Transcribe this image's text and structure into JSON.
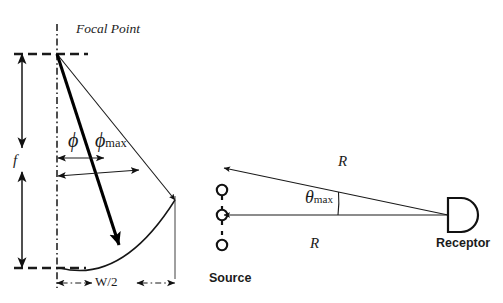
{
  "figure": {
    "width": 503,
    "height": 303,
    "background": "#ffffff",
    "ink_color": "#111111",
    "title": ""
  },
  "labels": {
    "focal_point": "Focal Point",
    "focal_length": "f",
    "phi": "ϕ",
    "phi_max_symbol": "ϕ",
    "phi_max_subscript": "max",
    "half_width": "W/2",
    "range_upper": "R",
    "range_lower": "R",
    "theta_max_symbol": "θ",
    "theta_max_subscript": "max",
    "source": "Source",
    "receptor": "Receptor"
  },
  "left_panel": {
    "name": "parabolic-reflector-geometry",
    "focal_point": {
      "x": 57,
      "y": 54
    },
    "axis_vertical": {
      "x": 57,
      "y1": 24,
      "y2": 288,
      "style": "dash-dot"
    },
    "dashed_top": {
      "x1": 14,
      "y": 54,
      "x2": 86,
      "style": "dashed"
    },
    "dashed_bottom": {
      "x1": 14,
      "y": 268,
      "x2": 86,
      "style": "dashed"
    },
    "dimension_f": {
      "x": 22,
      "y_top": 54,
      "y_bottom": 268,
      "gap_top": 148,
      "gap_bottom": 170,
      "label": "f",
      "arrows": "double"
    },
    "dimension_w2": {
      "y": 283,
      "x_left": 57,
      "x_right": 175,
      "label": "W/2",
      "style": "dash-dot",
      "arrows": "double"
    },
    "reflector_curve": {
      "start": {
        "x": 60,
        "y": 268
      },
      "control": {
        "x": 120,
        "y": 282
      },
      "end": {
        "x": 175,
        "y": 200
      },
      "type": "parabola"
    },
    "ray_phi": {
      "from": {
        "x": 57,
        "y": 54
      },
      "to": {
        "x": 122,
        "y": 251
      },
      "weight": "bold",
      "arrowhead": true
    },
    "ray_phi_max": {
      "from": {
        "x": 57,
        "y": 54
      },
      "to": {
        "x": 175,
        "y": 200
      },
      "weight": "thin",
      "arrowhead": true
    },
    "arc_phi": {
      "from_x": 57,
      "to_x": 105,
      "y": 158,
      "arrows": "double"
    },
    "arc_phi_max": {
      "from_x": 57,
      "to_x": 138,
      "y": 175,
      "arrows": "double"
    },
    "edge_vertical": {
      "x": 175,
      "y1": 196,
      "y2": 278
    }
  },
  "right_panel": {
    "name": "source-receptor-geometry",
    "source": {
      "label": "Source",
      "axis_x": 222,
      "circles": [
        {
          "cx": 222,
          "cy": 190,
          "r": 5.2
        },
        {
          "cx": 222,
          "cy": 215,
          "r": 5.2
        },
        {
          "cx": 222,
          "cy": 245,
          "r": 5.2
        }
      ],
      "chain_segments": [
        {
          "x": 222,
          "y1": 168,
          "y2": 184
        },
        {
          "x": 222,
          "y1": 196,
          "y2": 209
        },
        {
          "x": 222,
          "y1": 221,
          "y2": 240
        }
      ]
    },
    "receptor": {
      "label": "Receptor",
      "rect": {
        "x": 448,
        "y": 198,
        "width": 22,
        "height": 34
      },
      "dome_radius": 17,
      "tip": {
        "x": 448,
        "y": 215
      }
    },
    "path_upper": {
      "label": "R",
      "from": {
        "x": 448,
        "y": 215
      },
      "to": {
        "x": 222,
        "y": 168
      },
      "arrowhead": true
    },
    "path_lower": {
      "label": "R",
      "from": {
        "x": 448,
        "y": 215
      },
      "to": {
        "x": 222,
        "y": 215
      },
      "arrowhead": true
    },
    "angle_arc": {
      "label": "theta_max",
      "vertex": {
        "x": 448,
        "y": 215
      },
      "radius": 113,
      "between": [
        "path_lower",
        "path_upper"
      ]
    }
  }
}
